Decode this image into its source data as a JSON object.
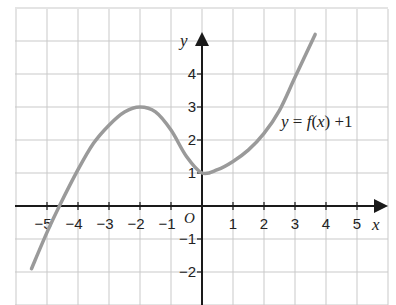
{
  "chart_data": {
    "type": "line",
    "title": "",
    "xlabel": "x",
    "ylabel": "y",
    "origin_label": "O",
    "xlim": [
      -6,
      6
    ],
    "ylim": [
      -3,
      6
    ],
    "grid": true,
    "x_ticks": [
      -5,
      -4,
      -3,
      -2,
      -1,
      1,
      2,
      3,
      4,
      5
    ],
    "x_tick_labels": [
      "−5",
      "−4",
      "−3",
      "−2",
      "−1",
      "1",
      "2",
      "3",
      "4",
      "5"
    ],
    "y_ticks": [
      -2,
      -1,
      1,
      2,
      3,
      4
    ],
    "y_tick_labels": [
      "−2",
      "−1",
      "1",
      "2",
      "3",
      "4"
    ],
    "series": [
      {
        "name": "y = f(x) +1",
        "color": "#9a9a9a",
        "x": [
          -5.5,
          -5,
          -4.6,
          -4,
          -3.5,
          -3,
          -2.5,
          -2,
          -1.5,
          -1,
          -0.5,
          0,
          0.5,
          1,
          1.5,
          2,
          2.5,
          3,
          3.65
        ],
        "y": [
          -1.9,
          -0.8,
          0,
          1.1,
          1.9,
          2.45,
          2.85,
          3,
          2.85,
          2.3,
          1.5,
          1.0,
          1.1,
          1.35,
          1.7,
          2.2,
          2.9,
          3.9,
          5.2
        ]
      }
    ],
    "annotations": [
      {
        "text": "y = f(x) +1",
        "x": 2.5,
        "y": 2.4
      }
    ],
    "key_points": {
      "local_max": [
        -2,
        3
      ],
      "local_min": [
        0,
        1
      ],
      "x_intercept": [
        -4.6,
        0
      ]
    }
  },
  "labels": {
    "x_axis": "x",
    "y_axis": "y",
    "origin": "O",
    "function": {
      "y": "y",
      "eq": " = ",
      "f": "f",
      "open": "(",
      "x": "x",
      "close": ")",
      "plus": " +1"
    }
  }
}
